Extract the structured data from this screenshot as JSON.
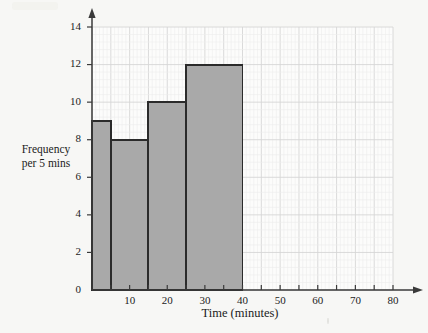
{
  "chart_data": {
    "type": "bar",
    "title": "",
    "subtitle": "",
    "xlabel": "Time (minutes)",
    "ylabel": "Frequency per 5 mins",
    "ylabel_lines": [
      "Frequency",
      "per 5 mins"
    ],
    "xlim": [
      0,
      80
    ],
    "ylim": [
      0,
      14
    ],
    "grid": true,
    "grid_minor": true,
    "legend": false,
    "legend_position": "none",
    "x_tick_labels": [
      "10",
      "20",
      "30",
      "40",
      "50",
      "60",
      "70",
      "80"
    ],
    "x_tick_values": [
      10,
      20,
      30,
      40,
      50,
      60,
      70,
      80
    ],
    "x_tick_step_minor": 5,
    "y_tick_labels": [
      "0",
      "2",
      "4",
      "6",
      "8",
      "10",
      "12",
      "14"
    ],
    "y_tick_values": [
      0,
      2,
      4,
      6,
      8,
      10,
      12,
      14
    ],
    "bars": [
      {
        "label": "0 - 5",
        "x_start": 0,
        "x_end": 5,
        "value": 9
      },
      {
        "label": "5 - 15",
        "x_start": 5,
        "x_end": 15,
        "value": 8
      },
      {
        "label": "15 - 25",
        "x_start": 15,
        "x_end": 25,
        "value": 10
      },
      {
        "label": "25 - 40",
        "x_start": 25,
        "x_end": 40,
        "value": 12
      }
    ],
    "categories": [
      "0 - 5",
      "5 - 15",
      "15 - 25",
      "25 - 40"
    ],
    "values": [
      9,
      8,
      10,
      12
    ],
    "colors": {
      "bar_fill": "#a9a9a9",
      "bar_stroke": "#2b2b2b",
      "axis": "#3a3a3a",
      "grid_major": "#d6d6d6",
      "grid_minor": "#ececec",
      "text": "#1c1c1c",
      "background": "#f7f7f5",
      "plot_background": "#fcfcfb"
    }
  }
}
